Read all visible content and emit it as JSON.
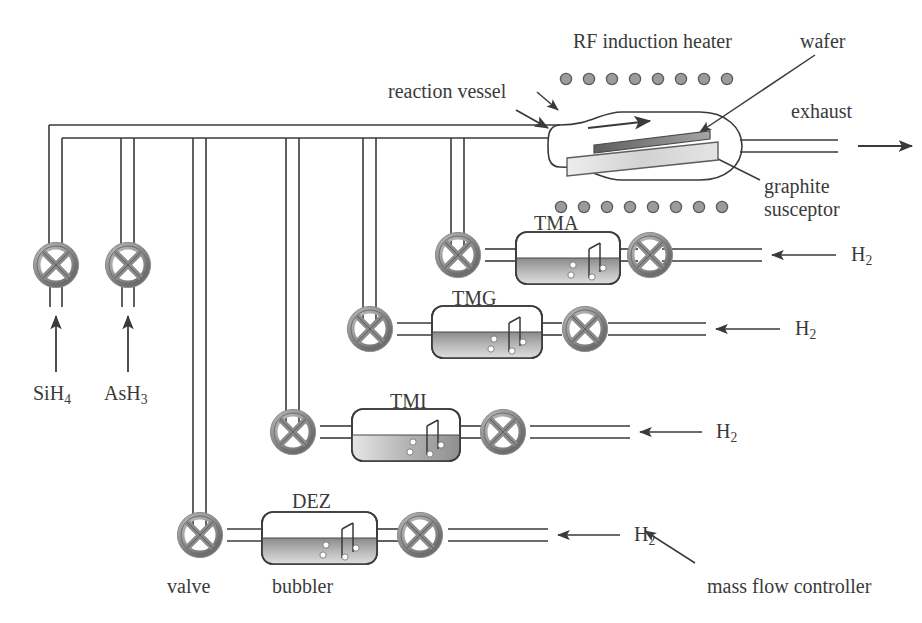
{
  "diagram": {
    "labels": {
      "rf_heater": "RF induction heater",
      "wafer": "wafer",
      "reaction_vessel": "reaction vessel",
      "exhaust": "exhaust",
      "graphite": "graphite",
      "susceptor": "susceptor",
      "valve": "valve",
      "bubbler": "bubbler",
      "mass_flow_controller": "mass flow controller"
    },
    "gas_inlets": [
      {
        "id": "sih4",
        "formula": "SiH",
        "subscript": "4",
        "x": 56
      },
      {
        "id": "ash3",
        "formula": "AsH",
        "subscript": "3",
        "x": 128
      }
    ],
    "sources": [
      {
        "id": "tma",
        "label": "TMA",
        "carrier": "H",
        "carrier_subscript": "2",
        "row": 1
      },
      {
        "id": "tmg",
        "label": "TMG",
        "carrier": "H",
        "carrier_subscript": "2",
        "row": 2
      },
      {
        "id": "tmi",
        "label": "TMI",
        "carrier": "H",
        "carrier_subscript": "2",
        "row": 3
      },
      {
        "id": "dez",
        "label": "DEZ",
        "carrier": "H",
        "carrier_subscript": "2",
        "row": 4
      }
    ],
    "heater_coils": {
      "top_count": 8,
      "bottom_count": 8
    },
    "colors": {
      "line": "#3a3a3a",
      "valve_ring": "#9a9a9a",
      "valve_ring_dark": "#6d6d6d",
      "bubbler_liquid_dark": "#8d8d8d",
      "bubbler_liquid_light": "#d8d8d8",
      "wafer": "#6f6f6f",
      "susceptor": "#dcdcdc",
      "coil": "#7f7f7f",
      "text": "#3a3a3a"
    }
  }
}
